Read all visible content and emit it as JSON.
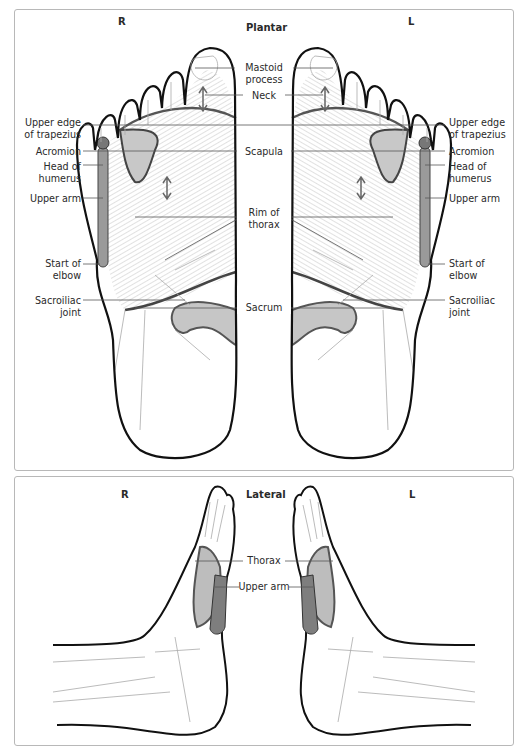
{
  "plantar": {
    "title": "Plantar",
    "side_right": "R",
    "side_left": "L",
    "labels_left": {
      "upper_edge_trapezius": [
        "Upper edge",
        "of trapezius"
      ],
      "acromion": [
        "Acromion"
      ],
      "head_of_humerus": [
        "Head of",
        "humerus"
      ],
      "upper_arm": [
        "Upper arm"
      ],
      "start_of_elbow": [
        "Start of",
        "elbow"
      ],
      "sacroiliac_joint": [
        "Sacroiliac",
        "joint"
      ]
    },
    "labels_center": {
      "mastoid_process": [
        "Mastoid",
        "process"
      ],
      "neck": [
        "Neck"
      ],
      "scapula": [
        "Scapula"
      ],
      "rim_of_thorax": [
        "Rim of",
        "thorax"
      ],
      "sacrum": [
        "Sacrum"
      ]
    },
    "labels_right": {
      "upper_edge_trapezius": [
        "Upper edge",
        "of trapezius"
      ],
      "acromion": [
        "Acromion"
      ],
      "head_of_humerus": [
        "Head of",
        "humerus"
      ],
      "upper_arm": [
        "Upper arm"
      ],
      "start_of_elbow": [
        "Start of",
        "elbow"
      ],
      "sacroiliac_joint": [
        "Sacroiliac",
        "joint"
      ]
    }
  },
  "lateral": {
    "title": "Lateral",
    "side_right": "R",
    "side_left": "L",
    "labels_center": {
      "thorax": [
        "Thorax"
      ],
      "upper_arm": [
        "Upper arm"
      ]
    }
  },
  "colors": {
    "outline": "#111111",
    "bone_line": "#9a9a9a",
    "shading": "#b9b9b9",
    "dark_shading": "#6f6f6f",
    "frame": "#b8b8b8",
    "leader": "#555555"
  }
}
